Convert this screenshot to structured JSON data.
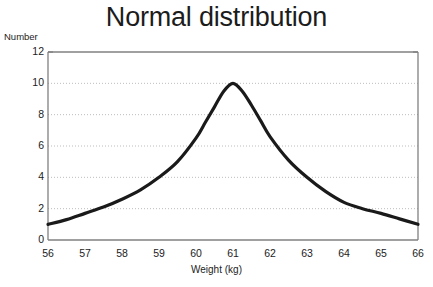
{
  "chart_data": {
    "type": "line",
    "title": "Normal distribution",
    "xlabel": "Weight (kg)",
    "ylabel": "Number",
    "xlim": [
      56,
      66
    ],
    "ylim": [
      0,
      12
    ],
    "xticks": [
      56,
      57,
      58,
      59,
      60,
      61,
      62,
      63,
      64,
      65,
      66
    ],
    "yticks": [
      0,
      2,
      4,
      6,
      8,
      10,
      12
    ],
    "grid": "horizontal-dotted",
    "legend": "none",
    "series": [
      {
        "name": "Number",
        "x": [
          56,
          56.5,
          57,
          57.5,
          58,
          58.5,
          59,
          59.5,
          60,
          60.25,
          60.5,
          60.75,
          61,
          61.25,
          61.5,
          61.75,
          62,
          62.5,
          63,
          63.5,
          64,
          64.5,
          65,
          65.5,
          66
        ],
        "values": [
          1.0,
          1.3,
          1.7,
          2.1,
          2.6,
          3.2,
          4.0,
          5.0,
          6.5,
          7.5,
          8.5,
          9.5,
          10.0,
          9.5,
          8.6,
          7.6,
          6.6,
          5.1,
          4.0,
          3.1,
          2.4,
          2.0,
          1.7,
          1.35,
          1.0
        ]
      }
    ],
    "colors": {
      "curve": "#1a1a1a",
      "frame": "#808080",
      "grid": "#bdbdbd",
      "text": "#1c1c1c"
    }
  }
}
